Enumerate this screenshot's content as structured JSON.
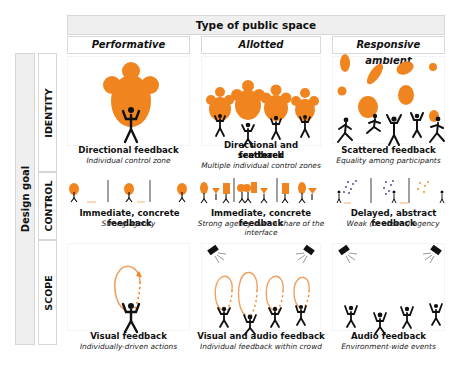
{
  "header": {
    "title": "Type of public space",
    "columns": [
      "Performative",
      "Allotted",
      "Responsive ambient"
    ]
  },
  "side": {
    "title": "Design goal",
    "rows": [
      "IDENTITY",
      "CONTROL",
      "SCOPE"
    ]
  },
  "colors": {
    "accent_orange": "#f0841f",
    "figure_black": "#111111",
    "header_fill": "#efefef",
    "border": "#d6d6d6",
    "dot_blue": "#3a3f8f"
  },
  "cells": {
    "identity": {
      "performative": {
        "title": "Directional feedback",
        "subtitle": "Individual control zone",
        "icon": "single-person-orange-blob-icon"
      },
      "allotted": {
        "title_line1": "Directional and scattered",
        "title_line2": "feedback",
        "subtitle": "Multiple individual control zones",
        "icon": "four-people-orange-blobs-icon"
      },
      "responsive": {
        "title": "Scattered feedback",
        "subtitle": "Equality among participants",
        "icon": "crowd-scattered-blobs-icon"
      }
    },
    "control": {
      "performative": {
        "title": "Immediate, concrete feedback",
        "subtitle": "Strong agency",
        "icon": "sequence-person-blob-icon"
      },
      "allotted": {
        "title": "Immediate, concrete feedback",
        "subtitle_line1": "Strong agency over a share of the",
        "subtitle_line2": "interface",
        "icon": "sequence-shared-shapes-icon"
      },
      "responsive": {
        "title": "Delayed, abstract feedback",
        "subtitle": "Weak (or absent) agency",
        "icon": "sequence-dots-icon"
      }
    },
    "scope": {
      "performative": {
        "title": "Visual feedback",
        "subtitle": "Individually-driven actions",
        "icon": "person-orange-loop-icon"
      },
      "allotted": {
        "title": "Visual and audio feedback",
        "subtitle": "Individual feedback within crowd",
        "icon": "speakers-loops-crowd-icon"
      },
      "responsive": {
        "title": "Audio feedback",
        "subtitle": "Environment-wide events",
        "icon": "speakers-crowd-icon"
      }
    }
  }
}
